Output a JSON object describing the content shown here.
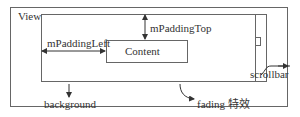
{
  "diagram": {
    "outer_label": "View",
    "content_label": "Content",
    "padding_left_label": "mPaddingLeft",
    "padding_top_label": "mPaddingTop",
    "scrollbar_label": "scrollbar",
    "background_label": "background",
    "fading_label": "fading 特效"
  },
  "colors": {
    "line": "#666666",
    "text": "#333333",
    "background": "#ffffff"
  }
}
